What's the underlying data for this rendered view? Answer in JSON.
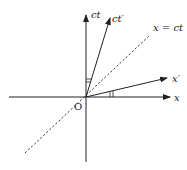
{
  "diagram": {
    "type": "spacetime-minkowski",
    "colors": {
      "stroke": "#222222",
      "background": "#ffffff"
    },
    "labels": {
      "ct": "ct",
      "ct_prime": "ct′",
      "light_line": "x = ct",
      "x_prime": "x′",
      "x": "x",
      "origin": "O"
    },
    "axes": [
      {
        "name": "x",
        "style": "solid",
        "arrow": true
      },
      {
        "name": "ct",
        "style": "solid",
        "arrow": true
      },
      {
        "name": "x′",
        "style": "solid",
        "arrow": true
      },
      {
        "name": "ct′",
        "style": "solid",
        "arrow": true
      },
      {
        "name": "x = ct",
        "style": "dashed",
        "arrow": false
      }
    ],
    "angle_marks": [
      "between ct and ct′",
      "between x and x′"
    ]
  }
}
